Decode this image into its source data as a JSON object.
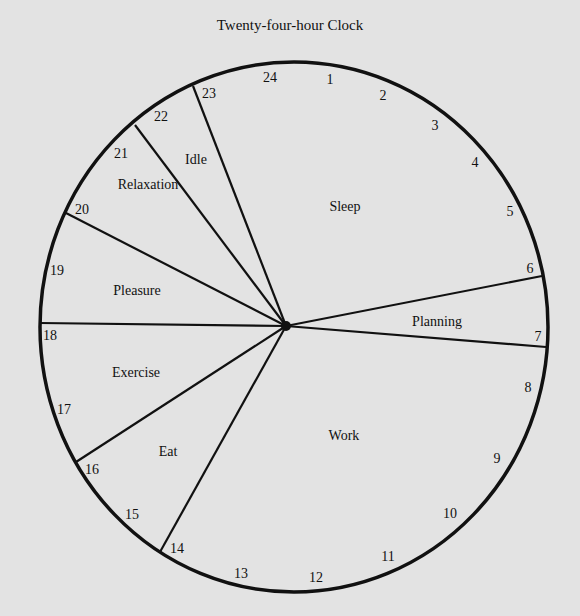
{
  "title": "Twenty-four-hour Clock",
  "colors": {
    "background": "#e3e3e3",
    "ink": "#111111"
  },
  "clock": {
    "center": [
      286,
      326
    ],
    "ellipse": {
      "cx": 294,
      "cy": 327,
      "rx": 254,
      "ry": 265
    },
    "hours": [
      {
        "label": "24",
        "x": 270,
        "y": 82
      },
      {
        "label": "1",
        "x": 330,
        "y": 84
      },
      {
        "label": "2",
        "x": 383,
        "y": 100
      },
      {
        "label": "3",
        "x": 435,
        "y": 130
      },
      {
        "label": "4",
        "x": 475,
        "y": 167
      },
      {
        "label": "5",
        "x": 510,
        "y": 216
      },
      {
        "label": "6",
        "x": 530,
        "y": 273
      },
      {
        "label": "7",
        "x": 538,
        "y": 341
      },
      {
        "label": "8",
        "x": 528,
        "y": 392
      },
      {
        "label": "9",
        "x": 497,
        "y": 463
      },
      {
        "label": "10",
        "x": 450,
        "y": 518
      },
      {
        "label": "11",
        "x": 388,
        "y": 561
      },
      {
        "label": "12",
        "x": 316,
        "y": 582
      },
      {
        "label": "13",
        "x": 241,
        "y": 578
      },
      {
        "label": "14",
        "x": 177,
        "y": 553
      },
      {
        "label": "15",
        "x": 132,
        "y": 519
      },
      {
        "label": "16",
        "x": 92,
        "y": 474
      },
      {
        "label": "17",
        "x": 64,
        "y": 414
      },
      {
        "label": "18",
        "x": 50,
        "y": 340
      },
      {
        "label": "19",
        "x": 57,
        "y": 275
      },
      {
        "label": "20",
        "x": 82,
        "y": 214
      },
      {
        "label": "21",
        "x": 121,
        "y": 158
      },
      {
        "label": "22",
        "x": 161,
        "y": 121
      },
      {
        "label": "23",
        "x": 209,
        "y": 98
      }
    ],
    "dividers": [
      {
        "hour": "23",
        "x": 193,
        "y": 86
      },
      {
        "hour": "22",
        "x": 135,
        "y": 125
      },
      {
        "hour": "20",
        "x": 66,
        "y": 213
      },
      {
        "hour": "18",
        "x": 40,
        "y": 323
      },
      {
        "hour": "16",
        "x": 76,
        "y": 462
      },
      {
        "hour": "14",
        "x": 160,
        "y": 552
      },
      {
        "hour": "7",
        "x": 546,
        "y": 347
      },
      {
        "hour": "6",
        "x": 542,
        "y": 276
      }
    ],
    "segments": [
      {
        "label": "Sleep",
        "x": 345,
        "y": 211,
        "from": "23",
        "to": "6"
      },
      {
        "label": "Planning",
        "x": 437,
        "y": 326,
        "from": "6",
        "to": "7"
      },
      {
        "label": "Work",
        "x": 344,
        "y": 440,
        "from": "7",
        "to": "14"
      },
      {
        "label": "Eat",
        "x": 168,
        "y": 456,
        "from": "14",
        "to": "16"
      },
      {
        "label": "Exercise",
        "x": 136,
        "y": 377,
        "from": "16",
        "to": "18"
      },
      {
        "label": "Pleasure",
        "x": 137,
        "y": 295,
        "from": "18",
        "to": "20"
      },
      {
        "label": "Relaxation",
        "x": 148,
        "y": 189,
        "from": "20",
        "to": "22"
      },
      {
        "label": "Idle",
        "x": 196,
        "y": 164,
        "from": "22",
        "to": "23"
      }
    ]
  }
}
